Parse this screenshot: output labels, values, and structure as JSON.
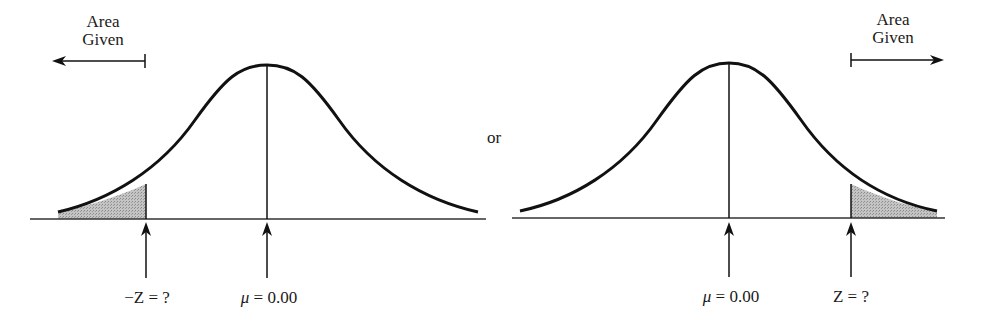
{
  "diagram": {
    "type": "normal-distribution-tail-areas",
    "separator_text": "or",
    "colors": {
      "line": "#1a1a1a",
      "shade": "#b8b8b8",
      "background": "#ffffff"
    },
    "left_panel": {
      "area_label_line1": "Area",
      "area_label_line2": "Given",
      "area_arrow_direction": "left",
      "shaded_tail": "left",
      "marker_z_label": "−Z = ?",
      "marker_mean_symbol": "μ",
      "marker_mean_value": " = 0.00"
    },
    "right_panel": {
      "area_label_line1": "Area",
      "area_label_line2": "Given",
      "area_arrow_direction": "right",
      "shaded_tail": "right",
      "marker_z_label": "Z = ?",
      "marker_mean_symbol": "μ",
      "marker_mean_value": " = 0.00"
    }
  }
}
